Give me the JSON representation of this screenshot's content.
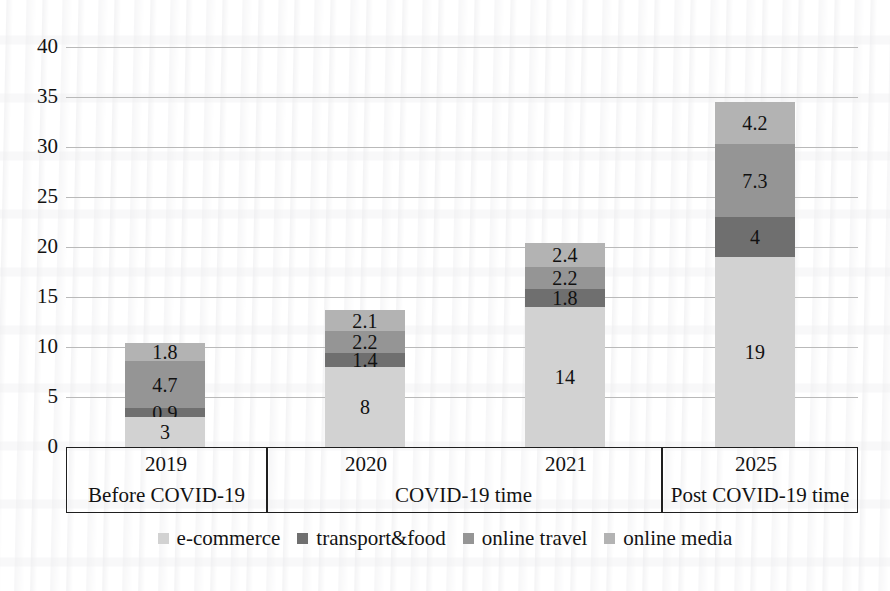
{
  "chart_data": {
    "type": "bar",
    "stacked": true,
    "title": "",
    "xlabel": "",
    "ylabel": "",
    "ylim": [
      0,
      40
    ],
    "ytick_step": 5,
    "yticks": [
      "40",
      "35",
      "30",
      "25",
      "20",
      "15",
      "10",
      "5",
      "0"
    ],
    "grid": true,
    "legend_position": "bottom",
    "categories": [
      "2019",
      "2020",
      "2021",
      "2025"
    ],
    "groups": [
      {
        "label": "Before COVID-19",
        "categories": [
          "2019"
        ]
      },
      {
        "label": "COVID-19 time",
        "categories": [
          "2020",
          "2021"
        ]
      },
      {
        "label": "Post COVID-19 time",
        "categories": [
          "2025"
        ]
      }
    ],
    "series": [
      {
        "name": "e-commerce",
        "color": "#d2d2d2",
        "values": [
          3,
          8,
          14,
          19
        ],
        "labels": [
          "3",
          "8",
          "14",
          "19"
        ]
      },
      {
        "name": "transport&food",
        "color": "#6f6f6f",
        "values": [
          0.9,
          1.4,
          1.8,
          4
        ],
        "labels": [
          "0.9",
          "1.4",
          "1.8",
          "4"
        ]
      },
      {
        "name": "online travel",
        "color": "#959595",
        "values": [
          4.7,
          2.2,
          2.2,
          7.3
        ],
        "labels": [
          "4.7",
          "2.2",
          "2.2",
          "7.3"
        ]
      },
      {
        "name": "online media",
        "color": "#b3b3b3",
        "values": [
          1.8,
          2.1,
          2.4,
          4.2
        ],
        "labels": [
          "1.8",
          "2.1",
          "2.4",
          "4.2"
        ]
      }
    ],
    "totals": [
      10.4,
      13.7,
      20.4,
      34.5
    ]
  },
  "legend": {
    "items": [
      {
        "label": "e-commerce",
        "color": "#d2d2d2"
      },
      {
        "label": "transport&food",
        "color": "#6f6f6f"
      },
      {
        "label": "online travel",
        "color": "#959595"
      },
      {
        "label": "online media",
        "color": "#b3b3b3"
      }
    ]
  }
}
